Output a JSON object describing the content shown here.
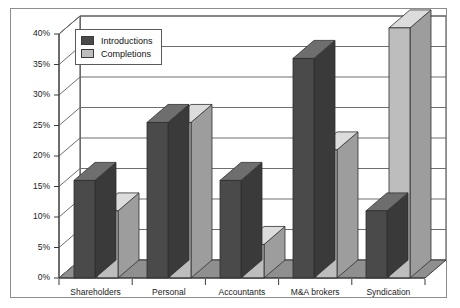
{
  "chart_data": {
    "type": "bar",
    "title": "",
    "subtitle": "",
    "xlabel": "",
    "ylabel": "",
    "categories": [
      "Shareholders",
      "Personal",
      "Accountants",
      "M&A brokers",
      "Syndication"
    ],
    "series": [
      {
        "name": "Introductions",
        "color": "#4a4a4a",
        "values": [
          16,
          25.5,
          16,
          36,
          11
        ]
      },
      {
        "name": "Completions",
        "color": "#bdbdbd",
        "values": [
          11,
          25.5,
          5.5,
          21,
          41
        ]
      }
    ],
    "ylim": [
      0,
      40
    ],
    "ytick_values": [
      0,
      5,
      10,
      15,
      20,
      25,
      30,
      35,
      40
    ],
    "ytick_labels": [
      "0%",
      "5%",
      "10%",
      "15%",
      "20%",
      "25%",
      "30%",
      "35%",
      "40%"
    ],
    "grid": true,
    "grid_axis": "y",
    "legend_position": "upper-left-inside",
    "style": "3d-clustered-column",
    "colors": {
      "introductions_front": "#4a4a4a",
      "introductions_top": "#6e6e6e",
      "introductions_side": "#3a3a3a",
      "completions_front": "#bdbdbd",
      "completions_top": "#dcdcdc",
      "completions_side": "#9d9d9d",
      "floor": "#8f8f8f",
      "back_wall": "#ffffff",
      "gridline": "#6e6e6e",
      "axis": "#3a3a3a",
      "frame": "#8d8d8d",
      "text": "#1a1a1a"
    }
  },
  "legend": {
    "items": [
      {
        "label": "Introductions",
        "color": "#4a4a4a"
      },
      {
        "label": "Completions",
        "color": "#bdbdbd"
      }
    ]
  },
  "yaxis": {
    "labels": [
      "40%",
      "35%",
      "30%",
      "25%",
      "20%",
      "15%",
      "10%",
      "5%",
      "0%"
    ]
  },
  "xaxis": {
    "labels": [
      "Shareholders",
      "Personal",
      "Accountants",
      "M&A brokers",
      "Syndication"
    ]
  }
}
